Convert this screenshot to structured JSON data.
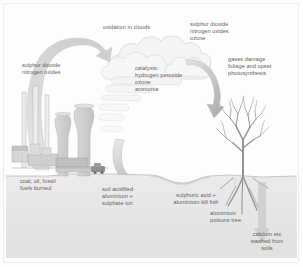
{
  "diagram": {
    "type": "process-diagram",
    "palette": {
      "background": "#fdfdfd",
      "text": "#5d5d5d",
      "plume": "#d7d7d7",
      "cloud": "#f2f2f2",
      "cloud_outline": "#cfcfcf",
      "arrow": "#b7b7b7",
      "ground": "#e6e6e6",
      "ground_line": "#b0b0b0",
      "structure": "#cdcdcd",
      "tree": "#9a9a9a",
      "border": "#ededed"
    },
    "labels": {
      "source_emissions": "sulphur dioxide\nnitrogen oxides",
      "oxidation": "oxidation in clouds",
      "upper_right_gases": "sulphur dioxide\nnitrogen oxides\nozone",
      "catalysis": "catalysis:\nhydrogen peroxide\nozone\nammonia",
      "foliage_damage": "gases damage\nfoliage and upset\nphotosynthesis",
      "fuel_source": "coal, oil, fossil\nfuels burned",
      "soil_acidified": "soil acidified\naluminium +\nsulphate ion",
      "fish_kill": "sulphuric acid +\naluminium kill fish",
      "tree_poison": "aluminium\npoisons tree",
      "leaching": "calcium etc\nwashed from\nsoils"
    },
    "elements": {
      "power_station": "power-station",
      "chimneys": "chimney-stacks",
      "cooling_towers": "cooling-towers",
      "vehicle": "truck",
      "tree": "bare-tree-with-roots",
      "lake": "acidified-lake",
      "cloud": "rain-cloud",
      "plume_arrow": "emission-plume-arrow",
      "descending_arrow": "gas-descent-arrow",
      "rain_arrow": "acid-rain-arrow"
    }
  }
}
